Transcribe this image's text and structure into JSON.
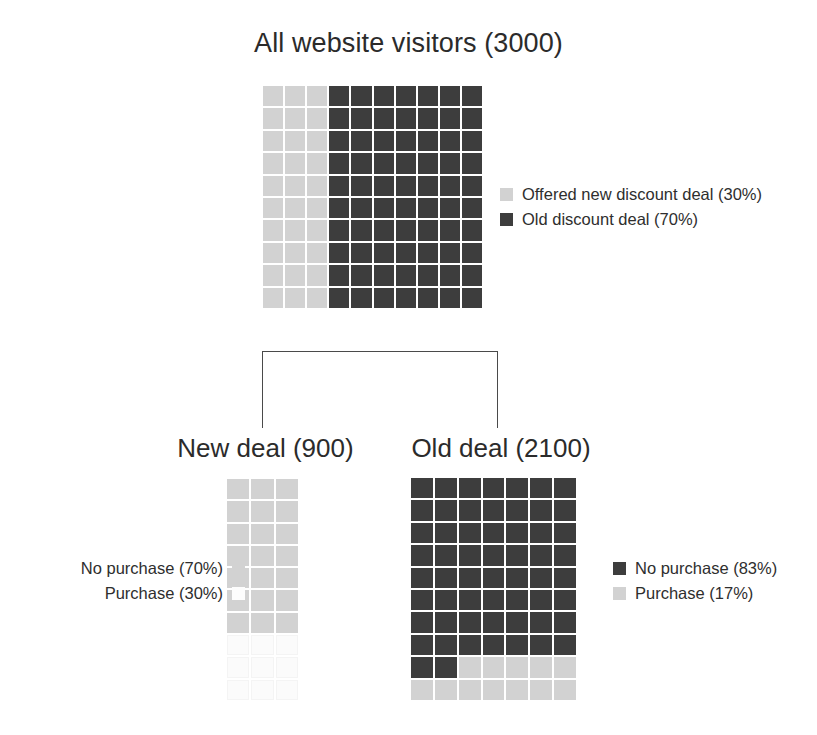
{
  "figure": {
    "title": "All website visitors (3000)"
  },
  "chart_data": {
    "type": "waffle",
    "title": "All website visitors (3000)",
    "grid_rows": 10,
    "grid_cols": 10,
    "fill_direction": "column-major",
    "panels": [
      {
        "name": "all-visitors",
        "title": "All website visitors (3000)",
        "total": 3000,
        "rows": 10,
        "cols": 10,
        "orientation": "columns",
        "categories": [
          "Offered new discount deal (30%)",
          "Old discount deal (70%)"
        ],
        "values": [
          30,
          70
        ],
        "counts": [
          900,
          2100
        ],
        "colors": [
          "#d2d2d2",
          "#3d3d3d"
        ],
        "legend_position": "right"
      },
      {
        "name": "new-deal",
        "title": "New deal (900)",
        "total": 900,
        "rows": 10,
        "cols": 3,
        "orientation": "rows",
        "categories": [
          "No purchase (70%)",
          "Purchase (30%)"
        ],
        "values": [
          70,
          30
        ],
        "counts": [
          630,
          270
        ],
        "colors": [
          "#d2d2d2",
          "#fbfbfb"
        ],
        "legend_position": "left"
      },
      {
        "name": "old-deal",
        "title": "Old deal (2100)",
        "total": 2100,
        "rows": 10,
        "cols": 7,
        "orientation": "rows",
        "categories": [
          "No purchase (83%)",
          "Purchase (17%)"
        ],
        "values": [
          83,
          17
        ],
        "counts": [
          1743,
          357
        ],
        "colors": [
          "#3d3d3d",
          "#d2d2d2"
        ],
        "legend_position": "right"
      }
    ],
    "connector": {
      "type": "bracket",
      "from": "all-visitors",
      "to": [
        "new-deal",
        "old-deal"
      ]
    }
  },
  "panels": {
    "top": {
      "legend": [
        {
          "label": "Offered new discount deal (30%)",
          "swatch": "light-gray-swatch"
        },
        {
          "label": "Old discount deal (70%)",
          "swatch": "dark-gray-swatch"
        }
      ]
    },
    "new_deal": {
      "title": "New deal (900)",
      "legend": [
        {
          "label": "No purchase (70%)",
          "swatch": "light-gray-swatch"
        },
        {
          "label": "Purchase (30%)",
          "swatch": "white-swatch"
        }
      ]
    },
    "old_deal": {
      "title": "Old deal (2100)",
      "legend": [
        {
          "label": "No purchase (83%)",
          "swatch": "dark-gray-swatch"
        },
        {
          "label": "Purchase (17%)",
          "swatch": "light-gray-swatch"
        }
      ]
    }
  },
  "colors": {
    "dark": "#3d3d3d",
    "light": "#d2d2d2",
    "pale": "#fbfbfb",
    "text": "#2b2b2b",
    "connector": "#4a4a4a"
  }
}
